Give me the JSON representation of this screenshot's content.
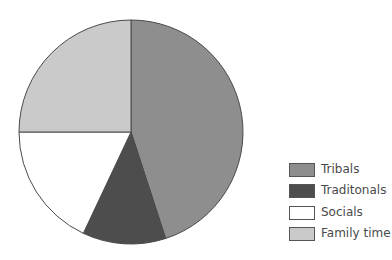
{
  "chart_data": {
    "type": "pie",
    "title": "",
    "categories": [
      "Tribals",
      "Traditonals",
      "Socials",
      "Family time"
    ],
    "values": [
      45,
      12,
      18,
      25
    ],
    "unit": "%",
    "colors": [
      "#8e8e8e",
      "#4d4d4d",
      "#ffffff",
      "#cacaca"
    ],
    "start_angle_deg": 0,
    "direction": "clockwise",
    "legend_position": "right-bottom",
    "legend": [
      {
        "label": "Tribals",
        "color": "#8e8e8e"
      },
      {
        "label": "Traditonals",
        "color": "#4d4d4d"
      },
      {
        "label": "Socials",
        "color": "#ffffff"
      },
      {
        "label": "Family time",
        "color": "#cacaca"
      }
    ]
  },
  "geometry": {
    "cx": 131,
    "cy": 132,
    "r": 112
  }
}
